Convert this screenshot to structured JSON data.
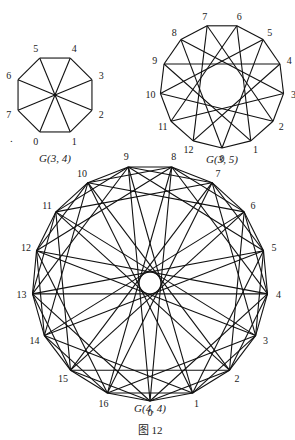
{
  "figure_caption": "图 12",
  "graphs": [
    {
      "id": "g34",
      "caption": "G(3, 4)",
      "n": 8,
      "steps": [
        1,
        4
      ],
      "center": [
        55,
        95
      ],
      "radius": 40,
      "label_offset": 10,
      "vertex0_angle_deg": 112.5,
      "direction": -1,
      "caption_pos": [
        55,
        162
      ],
      "labels": [
        "0",
        "1",
        "2",
        "3",
        "4",
        "5",
        "6",
        "7"
      ]
    },
    {
      "id": "g35",
      "caption": "G(3, 5)",
      "n": 13,
      "steps": [
        1,
        5
      ],
      "center": [
        222,
        86
      ],
      "radius": 62,
      "label_offset": 10,
      "vertex0_angle_deg": 90,
      "direction": -1,
      "caption_pos": [
        222,
        163
      ],
      "labels": [
        "0",
        "1",
        "2",
        "3",
        "4",
        "5",
        "6",
        "7",
        "8",
        "9",
        "10",
        "11",
        "12"
      ]
    },
    {
      "id": "g44",
      "caption": "G(4, 4)",
      "n": 17,
      "steps": [
        1,
        2,
        4,
        8
      ],
      "center": [
        150,
        283
      ],
      "radius": 118,
      "label_offset": 11,
      "vertex0_angle_deg": 90,
      "direction": -1,
      "caption_pos": [
        150,
        412
      ],
      "labels": [
        "0",
        "1",
        "2",
        "3",
        "4",
        "5",
        "6",
        "7",
        "8",
        "9",
        "10",
        "11",
        "12",
        "13",
        "14",
        "15",
        "16"
      ]
    }
  ],
  "stray_mark": {
    "text": ".",
    "pos": [
      10,
      142
    ]
  },
  "figure_caption_pos": [
    150,
    434
  ]
}
